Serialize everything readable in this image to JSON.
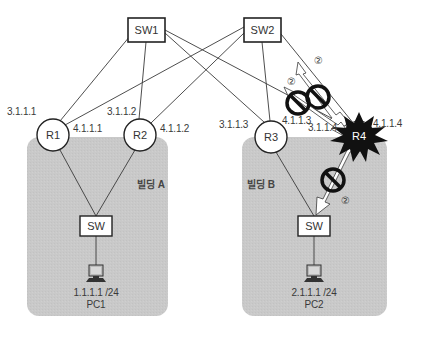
{
  "diagram": {
    "type": "network-topology",
    "colors": {
      "building_fill": "#c8c8c8",
      "line": "#3a3a3a",
      "failed_router_fill": "#111111",
      "block_symbol": "#111111",
      "background": "#ffffff"
    },
    "switches": [
      {
        "id": "sw1",
        "label": "SW1"
      },
      {
        "id": "sw2",
        "label": "SW2"
      },
      {
        "id": "swA",
        "label": "SW"
      },
      {
        "id": "swB",
        "label": "SW"
      }
    ],
    "routers": [
      {
        "id": "r1",
        "label": "R1",
        "ip_upper": "3.1.1.1",
        "ip_side": "4.1.1.1"
      },
      {
        "id": "r2",
        "label": "R2",
        "ip_upper": "3.1.1.2",
        "ip_side": "4.1.1.2"
      },
      {
        "id": "r3",
        "label": "R3",
        "ip_upper": "3.1.1.3",
        "ip_side": "4.1.1.3"
      },
      {
        "id": "r4",
        "label": "R4",
        "ip_upper": "3.1.1.4",
        "ip_side": "4.1.1.4",
        "state": "failed"
      }
    ],
    "buildings": [
      {
        "id": "bldA",
        "label": "빌딩 A"
      },
      {
        "id": "bldB",
        "label": "빌딩 B"
      }
    ],
    "hosts": [
      {
        "id": "pc1",
        "label": "PC1",
        "ip": "1.1.1.1 /24"
      },
      {
        "id": "pc2",
        "label": "PC2",
        "ip": "2.1.1.1 /24"
      }
    ],
    "blocked_paths": [
      {
        "id": "block1",
        "from": "r4",
        "to": "sw2",
        "marker": "②"
      },
      {
        "id": "block2",
        "from": "r4",
        "to": "sw1",
        "marker": "②"
      },
      {
        "id": "block3",
        "from": "r4",
        "to": "swB",
        "marker": "②"
      }
    ],
    "links": [
      {
        "from": "sw1",
        "to": "r1"
      },
      {
        "from": "sw1",
        "to": "r2"
      },
      {
        "from": "sw1",
        "to": "r3"
      },
      {
        "from": "sw1",
        "to": "r4"
      },
      {
        "from": "sw2",
        "to": "r1"
      },
      {
        "from": "sw2",
        "to": "r2"
      },
      {
        "from": "sw2",
        "to": "r3"
      },
      {
        "from": "sw2",
        "to": "r4"
      },
      {
        "from": "r1",
        "to": "swA"
      },
      {
        "from": "r2",
        "to": "swA"
      },
      {
        "from": "r3",
        "to": "swB"
      },
      {
        "from": "r4",
        "to": "swB"
      },
      {
        "from": "swA",
        "to": "pc1"
      },
      {
        "from": "swB",
        "to": "pc2"
      }
    ]
  }
}
